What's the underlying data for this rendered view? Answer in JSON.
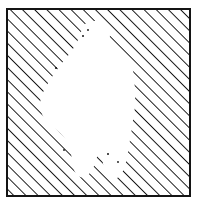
{
  "image": {
    "kind": "line-art-illustration",
    "title": "Hatched square with white human silhouette",
    "width": 198,
    "height": 210,
    "background_color": "#ffffff",
    "ink_color": "#141414"
  },
  "frame": {
    "name": "square-border",
    "x": 7,
    "y": 9,
    "width": 183,
    "height": 187,
    "stroke_color": "#141414",
    "stroke_width": 2,
    "fill": "none"
  },
  "hatching": {
    "name": "diagonal-hatch-fill",
    "angle_degrees": 45,
    "direction": "lower-left to upper-right",
    "line_spacing_px": 8.6,
    "line_width_px": 1.9,
    "line_color": "#141414",
    "coverage": "inside frame, outside silhouette"
  },
  "silhouette": {
    "name": "human-figure-negative-space",
    "fill_color": "#ffffff",
    "description": "Head, shoulders and torso tapering to two legs with a notch between them",
    "outline_points": [
      [
        88,
        22
      ],
      [
        96,
        21
      ],
      [
        103,
        23
      ],
      [
        108,
        28
      ],
      [
        110,
        35
      ],
      [
        109,
        43
      ],
      [
        114,
        46
      ],
      [
        122,
        50
      ],
      [
        128,
        57
      ],
      [
        132,
        66
      ],
      [
        134,
        78
      ],
      [
        135,
        92
      ],
      [
        135,
        106
      ],
      [
        133,
        120
      ],
      [
        131,
        134
      ],
      [
        129,
        146
      ],
      [
        127,
        158
      ],
      [
        124,
        168
      ],
      [
        120,
        176
      ],
      [
        113,
        179
      ],
      [
        107,
        176
      ],
      [
        104,
        168
      ],
      [
        102,
        158
      ],
      [
        100,
        150
      ],
      [
        97,
        157
      ],
      [
        94,
        166
      ],
      [
        90,
        173
      ],
      [
        84,
        177
      ],
      [
        78,
        176
      ],
      [
        74,
        170
      ],
      [
        72,
        160
      ],
      [
        70,
        148
      ],
      [
        66,
        140
      ],
      [
        60,
        133
      ],
      [
        53,
        127
      ],
      [
        46,
        121
      ],
      [
        42,
        114
      ],
      [
        40,
        105
      ],
      [
        42,
        95
      ],
      [
        47,
        85
      ],
      [
        54,
        74
      ],
      [
        62,
        63
      ],
      [
        70,
        53
      ],
      [
        76,
        44
      ],
      [
        80,
        35
      ],
      [
        83,
        27
      ]
    ]
  },
  "accents": {
    "name": "stray-hatch-flecks",
    "dots": [
      {
        "x": 56,
        "y": 68,
        "r": 1.1
      },
      {
        "x": 83,
        "y": 36,
        "r": 1.0
      },
      {
        "x": 88,
        "y": 30,
        "r": 0.9
      },
      {
        "x": 108,
        "y": 154,
        "r": 1.0
      },
      {
        "x": 118,
        "y": 162,
        "r": 0.9
      },
      {
        "x": 64,
        "y": 150,
        "r": 0.9
      }
    ]
  }
}
